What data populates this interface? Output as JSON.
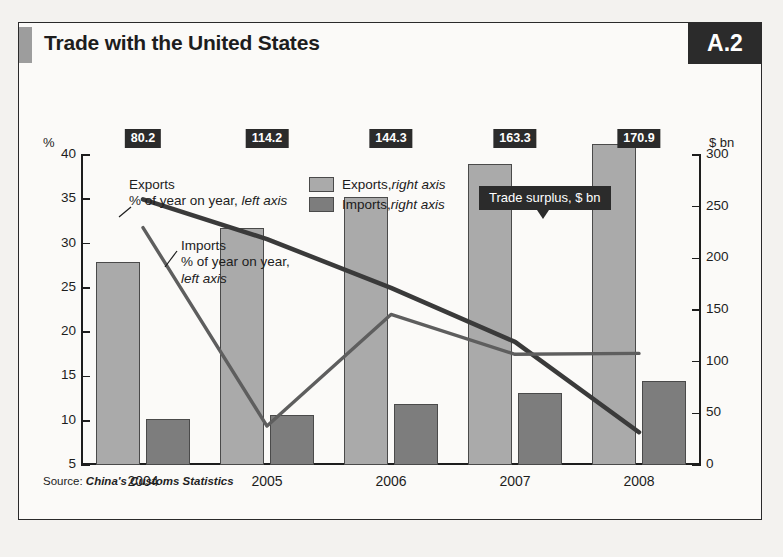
{
  "figure": {
    "title": "Trade with the United States",
    "badge": "A.2",
    "source_prefix": "Source: ",
    "source_text": "China's Customs Statistics"
  },
  "legend": {
    "exports": {
      "label": "Exports, ",
      "axis": "right axis"
    },
    "imports": {
      "label": "Imports, ",
      "axis": "right axis"
    }
  },
  "callout": {
    "surplus": "Trade surplus, $ bn"
  },
  "annotations": {
    "exports": {
      "line1": "Exports",
      "line2": "% of year on year, ",
      "line2_em": "left axis"
    },
    "imports": {
      "line1": "Imports",
      "line2": "% of year on year,",
      "line3": "left axis"
    }
  },
  "axes": {
    "left_unit": "%",
    "right_unit": "$ bn",
    "left_ticks": [
      "40",
      "35",
      "30",
      "25",
      "20",
      "15",
      "10",
      "5"
    ],
    "right_ticks": [
      "300",
      "250",
      "200",
      "150",
      "100",
      "50",
      "0"
    ]
  },
  "chart_data": {
    "type": "bar",
    "title": "Trade with the United States",
    "subtitle": "",
    "xlabel": "",
    "ylabel": "% of year on year",
    "y2label": "$ bn",
    "categories": [
      "2004",
      "2005",
      "2006",
      "2007",
      "2008"
    ],
    "ylim": [
      5,
      40
    ],
    "y2lim": [
      0,
      300
    ],
    "grid": false,
    "legend_position": "top-center",
    "series": [
      {
        "name": "Exports, right axis",
        "type": "bar",
        "axis": "right",
        "unit": "$ bn",
        "color": "#aaaaaa",
        "values": [
          196,
          229,
          259,
          291,
          311
        ]
      },
      {
        "name": "Imports, right axis",
        "type": "bar",
        "axis": "right",
        "unit": "$ bn",
        "color": "#7d7d7d",
        "values": [
          45,
          48,
          59,
          70,
          81
        ]
      },
      {
        "name": "Exports % of year on year, left axis",
        "type": "line",
        "axis": "left",
        "unit": "%",
        "color": "#3a3a3a",
        "values": [
          35.0,
          30.5,
          25.0,
          18.9,
          8.7
        ]
      },
      {
        "name": "Imports % of year on year, left axis",
        "type": "line",
        "axis": "left",
        "unit": "%",
        "color": "#5e5e5e",
        "values": [
          31.8,
          9.4,
          22.0,
          17.5,
          17.6
        ]
      }
    ],
    "annotations": [
      {
        "label": "80.2",
        "category": "2004",
        "series": "Trade surplus, $ bn"
      },
      {
        "label": "114.2",
        "category": "2005",
        "series": "Trade surplus, $ bn"
      },
      {
        "label": "144.3",
        "category": "2006",
        "series": "Trade surplus, $ bn"
      },
      {
        "label": "163.3",
        "category": "2007",
        "series": "Trade surplus, $ bn"
      },
      {
        "label": "170.9",
        "category": "2008",
        "series": "Trade surplus, $ bn"
      }
    ]
  }
}
